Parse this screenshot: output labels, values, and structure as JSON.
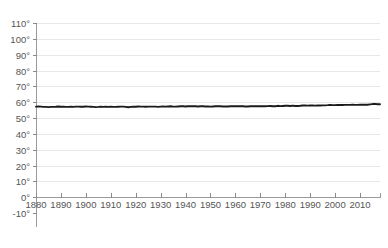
{
  "chart_data": {
    "type": "line",
    "title": "",
    "subtitle": "",
    "xlabel": "",
    "ylabel": "",
    "xlim": [
      1880,
      2018
    ],
    "ylim": [
      -10,
      110
    ],
    "grid": true,
    "legend": false,
    "legend_position": "none",
    "y_unit": "degrees Fahrenheit",
    "y_tick_labels": [
      "110°",
      "100°",
      "90°",
      "80°",
      "70°",
      "60°",
      "50°",
      "40°",
      "30°",
      "20°",
      "10°",
      "0°",
      "-10°"
    ],
    "y_tick_values": [
      110,
      100,
      90,
      80,
      70,
      60,
      50,
      40,
      30,
      20,
      10,
      0,
      -10
    ],
    "x_tick_labels": [
      "1880",
      "1890",
      "1900",
      "1910",
      "1920",
      "1930",
      "1940",
      "1950",
      "1960",
      "1970",
      "1980",
      "1990",
      "2000",
      "2010"
    ],
    "x_tick_values": [
      1880,
      1890,
      1900,
      1910,
      1920,
      1930,
      1940,
      1950,
      1960,
      1970,
      1980,
      1990,
      2000,
      2010
    ],
    "series": [
      {
        "name": "Average temperature",
        "color": "#1a1a1a",
        "x": [
          1880,
          1881,
          1882,
          1883,
          1884,
          1885,
          1886,
          1887,
          1888,
          1889,
          1890,
          1891,
          1892,
          1893,
          1894,
          1895,
          1896,
          1897,
          1898,
          1899,
          1900,
          1901,
          1902,
          1903,
          1904,
          1905,
          1906,
          1907,
          1908,
          1909,
          1910,
          1911,
          1912,
          1913,
          1914,
          1915,
          1916,
          1917,
          1918,
          1919,
          1920,
          1921,
          1922,
          1923,
          1924,
          1925,
          1926,
          1927,
          1928,
          1929,
          1930,
          1931,
          1932,
          1933,
          1934,
          1935,
          1936,
          1937,
          1938,
          1939,
          1940,
          1941,
          1942,
          1943,
          1944,
          1945,
          1946,
          1947,
          1948,
          1949,
          1950,
          1951,
          1952,
          1953,
          1954,
          1955,
          1956,
          1957,
          1958,
          1959,
          1960,
          1961,
          1962,
          1963,
          1964,
          1965,
          1966,
          1967,
          1968,
          1969,
          1970,
          1971,
          1972,
          1973,
          1974,
          1975,
          1976,
          1977,
          1978,
          1979,
          1980,
          1981,
          1982,
          1983,
          1984,
          1985,
          1986,
          1987,
          1988,
          1989,
          1990,
          1991,
          1992,
          1993,
          1994,
          1995,
          1996,
          1997,
          1998,
          1999,
          2000,
          2001,
          2002,
          2003,
          2004,
          2005,
          2006,
          2007,
          2008,
          2009,
          2010,
          2011,
          2012,
          2013,
          2014,
          2015,
          2016,
          2017,
          2018
        ],
        "y": [
          57.2,
          57.3,
          57.2,
          57.0,
          57.0,
          56.9,
          57.0,
          57.0,
          57.1,
          57.3,
          57.1,
          57.1,
          57.0,
          57.0,
          57.1,
          57.0,
          57.2,
          57.2,
          57.1,
          57.1,
          57.3,
          57.2,
          57.1,
          57.0,
          56.9,
          57.0,
          57.2,
          57.0,
          57.1,
          57.0,
          57.1,
          57.0,
          57.0,
          57.1,
          57.2,
          57.2,
          57.0,
          56.8,
          57.0,
          57.1,
          57.1,
          57.3,
          57.2,
          57.2,
          57.1,
          57.2,
          57.2,
          57.2,
          57.2,
          57.0,
          57.2,
          57.3,
          57.2,
          57.3,
          57.4,
          57.2,
          57.2,
          57.3,
          57.4,
          57.4,
          57.3,
          57.4,
          57.4,
          57.4,
          57.4,
          57.3,
          57.4,
          57.4,
          57.3,
          57.3,
          57.2,
          57.3,
          57.4,
          57.5,
          57.4,
          57.3,
          57.3,
          57.3,
          57.4,
          57.4,
          57.4,
          57.5,
          57.4,
          57.4,
          57.3,
          57.3,
          57.4,
          57.4,
          57.4,
          57.5,
          57.4,
          57.4,
          57.4,
          57.5,
          57.6,
          57.4,
          57.4,
          57.7,
          57.5,
          57.6,
          57.7,
          57.7,
          57.6,
          57.8,
          57.6,
          57.6,
          57.7,
          57.9,
          57.9,
          57.8,
          58.0,
          57.9,
          57.8,
          58.0,
          57.9,
          58.0,
          58.0,
          58.1,
          58.3,
          58.1,
          58.1,
          58.2,
          58.3,
          58.2,
          58.3,
          58.3,
          58.3,
          58.4,
          58.3,
          58.3,
          58.4,
          58.4,
          58.4,
          58.4,
          58.6,
          58.8,
          58.9,
          58.7,
          58.7
        ]
      }
    ]
  }
}
